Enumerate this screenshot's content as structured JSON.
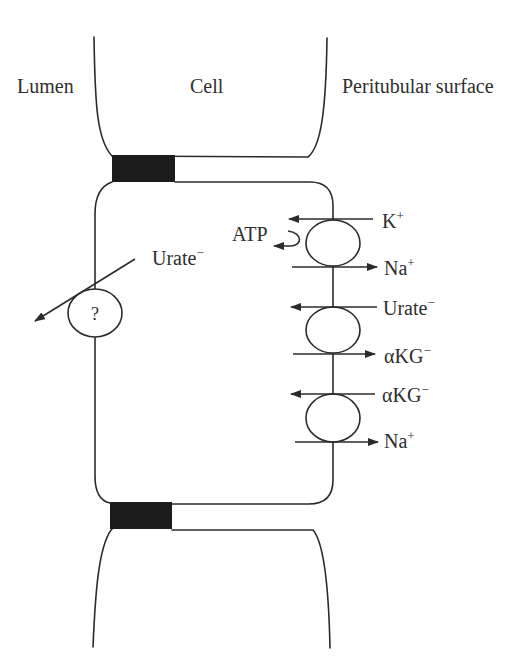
{
  "regions": {
    "lumen": "Lumen",
    "cell": "Cell",
    "peritubular": "Peritubular surface"
  },
  "apical_transporter": {
    "symbol": "?",
    "substrate": {
      "base": "Urate",
      "sup": "−",
      "arrow": "toward-lumen"
    }
  },
  "basolateral_transporters": [
    {
      "energy_label": "ATP",
      "ions": [
        {
          "base": "K",
          "sup": "+",
          "arrow": "left"
        },
        {
          "base": "Na",
          "sup": "+",
          "arrow": "right"
        }
      ]
    },
    {
      "ions": [
        {
          "base": "Urate",
          "sup": "−",
          "arrow": "left"
        },
        {
          "base": "αKG",
          "sup": "−",
          "arrow": "right"
        }
      ]
    },
    {
      "ions": [
        {
          "base": "αKG",
          "sup": "−",
          "arrow": "left"
        },
        {
          "base": "Na",
          "sup": "+",
          "arrow": "right"
        }
      ]
    }
  ],
  "colors": {
    "stroke": "#2b2b2b",
    "tight_junction": "#1c1c1c",
    "background": "#ffffff"
  }
}
